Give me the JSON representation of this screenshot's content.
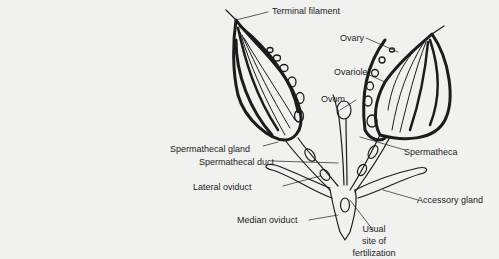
{
  "figure": {
    "labels": {
      "terminal_filament": "Terminal filament",
      "ovary": "Ovary",
      "ovariole": "Ovariole",
      "ovum": "Ovum",
      "spermathecal_gland": "Spermathecal gland",
      "spermathecal_duct": "Spermathecal duct",
      "spermatheca": "Spermatheca",
      "lateral_oviduct": "Lateral oviduct",
      "accessory_gland": "Accessory gland",
      "median_oviduct": "Median oviduct",
      "fertilization_site_line1": "Usual",
      "fertilization_site_line2": "site of",
      "fertilization_site_line3": "fertilization"
    },
    "colors": {
      "ink": "#1c1c1c",
      "paper": "#f1f1ef",
      "bleed_text": "#d9d9d6"
    }
  }
}
